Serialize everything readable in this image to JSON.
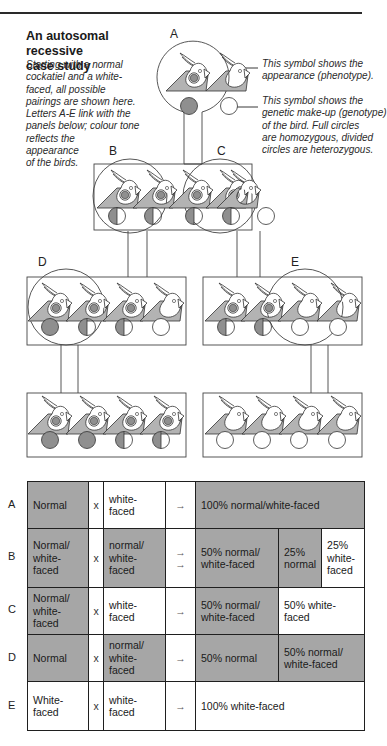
{
  "header": {
    "title_line1": "An autosomal recessive",
    "title_line2": "case study",
    "intro_lines": [
      "Starting with a normal",
      "cockatiel and a white-",
      "faced, all possible",
      "pairings are shown here.",
      "Letters A-E link with the",
      "panels below; colour tone",
      "reflects the",
      "appearance",
      "of the birds."
    ]
  },
  "notes": {
    "phenotype_lines": [
      "This symbol shows the",
      "appearance (phenotype)."
    ],
    "genotype_lines": [
      "This symbol shows the",
      "genetic make-up (genotype)",
      "of the bird. Full circles",
      "are homozygous, divided",
      "circles are heterozygous."
    ]
  },
  "panel_labels": {
    "A": "A",
    "B": "B",
    "C": "C",
    "D": "D",
    "E": "E"
  },
  "colors": {
    "bird_fill": "#b3b3b3",
    "genotype_fill": "#8f8f8f",
    "table_shade": "#a6a6a6",
    "line": "#333333"
  },
  "diagram": {
    "row0": [
      {
        "phenotype": "normal",
        "genotype": "full"
      },
      {
        "phenotype": "white-faced",
        "genotype": "empty"
      }
    ],
    "row1": [
      {
        "phenotype": "normal",
        "genotype": "half"
      },
      {
        "phenotype": "normal",
        "genotype": "half"
      },
      {
        "phenotype": "normal",
        "genotype": "half"
      },
      {
        "phenotype": "normal",
        "genotype": "half"
      },
      {
        "phenotype": "white-faced",
        "genotype": "empty"
      }
    ],
    "row2_left": [
      {
        "phenotype": "normal",
        "genotype": "full"
      },
      {
        "phenotype": "normal",
        "genotype": "half"
      },
      {
        "phenotype": "normal",
        "genotype": "half"
      },
      {
        "phenotype": "white-faced",
        "genotype": "empty"
      }
    ],
    "row2_right": [
      {
        "phenotype": "normal",
        "genotype": "half"
      },
      {
        "phenotype": "normal",
        "genotype": "half"
      },
      {
        "phenotype": "white-faced",
        "genotype": "empty"
      },
      {
        "phenotype": "white-faced",
        "genotype": "empty"
      }
    ],
    "row3_left": [
      {
        "phenotype": "normal",
        "genotype": "full"
      },
      {
        "phenotype": "normal",
        "genotype": "full"
      },
      {
        "phenotype": "normal",
        "genotype": "half"
      },
      {
        "phenotype": "normal",
        "genotype": "half"
      }
    ],
    "row3_right": [
      {
        "phenotype": "white-faced",
        "genotype": "empty"
      },
      {
        "phenotype": "white-faced",
        "genotype": "empty"
      },
      {
        "phenotype": "white-faced",
        "genotype": "empty"
      },
      {
        "phenotype": "white-faced",
        "genotype": "empty"
      }
    ]
  },
  "table": {
    "cross_symbol": "x",
    "arrow": "→",
    "rows": [
      {
        "label": "A",
        "parent1": "Normal",
        "parent2": "white-faced",
        "results": [
          "100% normal/white-faced"
        ]
      },
      {
        "label": "B",
        "parent1": "Normal/ white-faced",
        "parent2": "normal/ white-faced",
        "results": [
          "50% normal/ white-faced",
          "25% normal",
          "25% white-faced"
        ]
      },
      {
        "label": "C",
        "parent1": "Normal/ white-faced",
        "parent2": "white-faced",
        "results": [
          "50% normal/ white-faced",
          "50% white-faced"
        ]
      },
      {
        "label": "D",
        "parent1": "Normal",
        "parent2": "normal/ white-faced",
        "results": [
          "50% normal",
          "50% normal/ white-faced"
        ]
      },
      {
        "label": "E",
        "parent1": "White-faced",
        "parent2": "white-faced",
        "results": [
          "100% white-faced"
        ]
      }
    ]
  }
}
